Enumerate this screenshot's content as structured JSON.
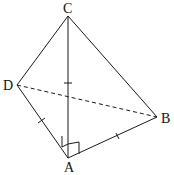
{
  "diagram": {
    "type": "tetrahedron",
    "vertices": {
      "A": {
        "label": "A",
        "x": 68,
        "y": 158
      },
      "B": {
        "label": "B",
        "x": 157,
        "y": 117
      },
      "C": {
        "label": "C",
        "x": 68,
        "y": 16
      },
      "D": {
        "label": "D",
        "x": 17,
        "y": 85
      }
    },
    "edges": [
      {
        "from": "C",
        "to": "A",
        "style": "solid",
        "tick_marks": 1
      },
      {
        "from": "C",
        "to": "D",
        "style": "solid",
        "tick_marks": 0
      },
      {
        "from": "C",
        "to": "B",
        "style": "solid",
        "tick_marks": 0
      },
      {
        "from": "D",
        "to": "A",
        "style": "solid",
        "tick_marks": 1
      },
      {
        "from": "A",
        "to": "B",
        "style": "solid",
        "tick_marks": 1
      },
      {
        "from": "D",
        "to": "B",
        "style": "dashed",
        "tick_marks": 0
      }
    ],
    "right_angles": [
      "DAC",
      "CAB"
    ],
    "colors": {
      "stroke": "#1a1a1a",
      "background": "#ffffff"
    }
  }
}
